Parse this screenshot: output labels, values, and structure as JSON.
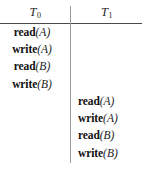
{
  "figure": {
    "type": "transaction-schedule-table",
    "background_color": "#ffffff",
    "rule_color": "#4a4a4a",
    "divider_color": "#9a9a9a"
  },
  "columns": [
    {
      "id": "T0",
      "header_base": "T",
      "header_subscript": "0",
      "operations": [
        {
          "name": "read",
          "arg": "(A)"
        },
        {
          "name": "write",
          "arg": "(A)"
        },
        {
          "name": "read",
          "arg": "(B)"
        },
        {
          "name": "write",
          "arg": "(B)"
        }
      ]
    },
    {
      "id": "T1",
      "header_base": "T",
      "header_subscript": "1",
      "operations": [
        {
          "name": "read",
          "arg": "(A)"
        },
        {
          "name": "write",
          "arg": "(A)"
        },
        {
          "name": "read",
          "arg": "(B)"
        },
        {
          "name": "write",
          "arg": "(B)"
        }
      ]
    }
  ]
}
